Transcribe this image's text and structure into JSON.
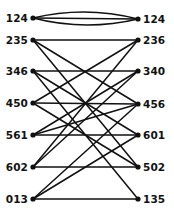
{
  "figure": {
    "type": "bipartite-graph-diagram",
    "background_color": "#ffffff",
    "ink_color": "#111111"
  },
  "graph": {
    "left_nodes": [
      {
        "id": "L0",
        "label": "124",
        "x": 33,
        "y": 18
      },
      {
        "id": "L1",
        "label": "235",
        "x": 33,
        "y": 40
      },
      {
        "id": "L2",
        "label": "346",
        "x": 33,
        "y": 71
      },
      {
        "id": "L3",
        "label": "450",
        "x": 33,
        "y": 103
      },
      {
        "id": "L4",
        "label": "561",
        "x": 33,
        "y": 135
      },
      {
        "id": "L5",
        "label": "602",
        "x": 33,
        "y": 167
      },
      {
        "id": "L6",
        "label": "013",
        "x": 33,
        "y": 199
      }
    ],
    "right_nodes": [
      {
        "id": "R0",
        "label": "124",
        "x": 138,
        "y": 19
      },
      {
        "id": "R1",
        "label": "236",
        "x": 138,
        "y": 40
      },
      {
        "id": "R2",
        "label": "340",
        "x": 138,
        "y": 71
      },
      {
        "id": "R3",
        "label": "456",
        "x": 138,
        "y": 104
      },
      {
        "id": "R4",
        "label": "601",
        "x": 138,
        "y": 135
      },
      {
        "id": "R5",
        "label": "502",
        "x": 138,
        "y": 167
      },
      {
        "id": "R6",
        "label": "135",
        "x": 138,
        "y": 199
      }
    ],
    "edges": [
      {
        "from": "L0",
        "to": "R0",
        "curve": -13
      },
      {
        "from": "L0",
        "to": "R0",
        "curve": 0
      },
      {
        "from": "L0",
        "to": "R0",
        "curve": 13
      },
      {
        "from": "L1",
        "to": "R1",
        "curve": 0
      },
      {
        "from": "L1",
        "to": "R3",
        "curve": 0
      },
      {
        "from": "L1",
        "to": "R5",
        "curve": 0
      },
      {
        "from": "L2",
        "to": "R2",
        "curve": 0
      },
      {
        "from": "L2",
        "to": "R4",
        "curve": 0
      },
      {
        "from": "L2",
        "to": "R6",
        "curve": 0
      },
      {
        "from": "L3",
        "to": "R3",
        "curve": 0
      },
      {
        "from": "L3",
        "to": "R1",
        "curve": 0
      },
      {
        "from": "L3",
        "to": "R5",
        "curve": 0
      },
      {
        "from": "L4",
        "to": "R4",
        "curve": 0
      },
      {
        "from": "L4",
        "to": "R2",
        "curve": 0
      },
      {
        "from": "L4",
        "to": "R3",
        "curve": 0
      },
      {
        "from": "L5",
        "to": "R5",
        "curve": 0
      },
      {
        "from": "L5",
        "to": "R2",
        "curve": 0
      },
      {
        "from": "L5",
        "to": "R1",
        "curve": 0
      },
      {
        "from": "L6",
        "to": "R6",
        "curve": 0
      },
      {
        "from": "L6",
        "to": "R4",
        "curve": 0
      },
      {
        "from": "L6",
        "to": "R3",
        "curve": 0
      }
    ],
    "node_radius": 2.6,
    "left_label_offset_x": -5,
    "right_label_offset_x": 5,
    "label_baseline_offset_y": 3.5
  }
}
